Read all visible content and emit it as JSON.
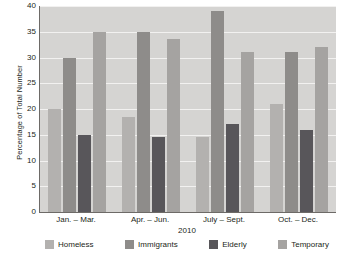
{
  "chart_data": {
    "type": "bar",
    "title": "",
    "xlabel": "2010",
    "ylabel": "Percentage of Total Number",
    "ylim": [
      0,
      40
    ],
    "ytick_step": 5,
    "yticks": [
      40,
      35,
      30,
      25,
      20,
      15,
      10,
      5,
      0
    ],
    "grid": true,
    "legend_position": "bottom",
    "categories": [
      "Jan. – Mar.",
      "Apr. – Jun.",
      "July – Sept.",
      "Oct. – Dec."
    ],
    "series": [
      {
        "name": "Homeless",
        "color": "#b3b1af",
        "values": [
          20,
          18.5,
          14.5,
          21
        ]
      },
      {
        "name": "Immigrants",
        "color": "#8e8c8a",
        "values": [
          30,
          35,
          39,
          31
        ]
      },
      {
        "name": "Elderly",
        "color": "#58565a",
        "values": [
          15,
          14.5,
          17,
          16
        ]
      },
      {
        "name": "Temporary",
        "color": "#a5a3a1",
        "values": [
          35,
          33.5,
          31,
          32
        ]
      }
    ]
  },
  "colors": {
    "plot_background": "#d5d4d2",
    "gridline": "#f2f1f0",
    "axis": "#6d6a67",
    "text": "#231f20"
  }
}
